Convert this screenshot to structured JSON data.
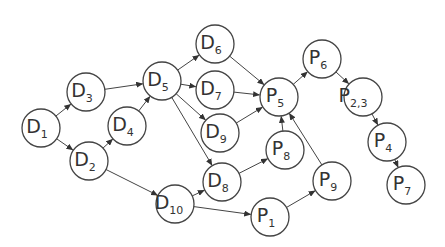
{
  "diagram": {
    "type": "directed-graph",
    "node_radius": 19,
    "colors": {
      "stroke": "#444444",
      "fill": "#ffffff",
      "text": "#333333"
    },
    "nodes": [
      {
        "id": "D1",
        "letter": "D",
        "sub": "1",
        "x": 41,
        "y": 128
      },
      {
        "id": "D2",
        "letter": "D",
        "sub": "2",
        "x": 89,
        "y": 161
      },
      {
        "id": "D3",
        "letter": "D",
        "sub": "3",
        "x": 86,
        "y": 92
      },
      {
        "id": "D4",
        "letter": "D",
        "sub": "4",
        "x": 127,
        "y": 126
      },
      {
        "id": "D5",
        "letter": "D",
        "sub": "5",
        "x": 162,
        "y": 81
      },
      {
        "id": "D6",
        "letter": "D",
        "sub": "6",
        "x": 215,
        "y": 44
      },
      {
        "id": "D7",
        "letter": "D",
        "sub": "7",
        "x": 215,
        "y": 90
      },
      {
        "id": "D8",
        "letter": "D",
        "sub": "8",
        "x": 222,
        "y": 182
      },
      {
        "id": "D9",
        "letter": "D",
        "sub": "9",
        "x": 220,
        "y": 133
      },
      {
        "id": "D10",
        "letter": "D",
        "sub": "10",
        "x": 175,
        "y": 204
      },
      {
        "id": "P1",
        "letter": "P",
        "sub": "1",
        "x": 270,
        "y": 217
      },
      {
        "id": "P23",
        "letter": "P",
        "sub": "2,3",
        "x": 363,
        "y": 97
      },
      {
        "id": "P4",
        "letter": "P",
        "sub": "4",
        "x": 387,
        "y": 142
      },
      {
        "id": "P5",
        "letter": "P",
        "sub": "5",
        "x": 279,
        "y": 97
      },
      {
        "id": "P6",
        "letter": "P",
        "sub": "6",
        "x": 322,
        "y": 59
      },
      {
        "id": "P7",
        "letter": "P",
        "sub": "7",
        "x": 406,
        "y": 185
      },
      {
        "id": "P8",
        "letter": "P",
        "sub": "8",
        "x": 285,
        "y": 150
      },
      {
        "id": "P9",
        "letter": "P",
        "sub": "9",
        "x": 332,
        "y": 181
      }
    ],
    "edges": [
      {
        "from": "D1",
        "to": "D3"
      },
      {
        "from": "D1",
        "to": "D2"
      },
      {
        "from": "D2",
        "to": "D4"
      },
      {
        "from": "D2",
        "to": "D10"
      },
      {
        "from": "D3",
        "to": "D5"
      },
      {
        "from": "D4",
        "to": "D5"
      },
      {
        "from": "D5",
        "to": "D6"
      },
      {
        "from": "D5",
        "to": "D7"
      },
      {
        "from": "D5",
        "to": "D9"
      },
      {
        "from": "D5",
        "to": "D8"
      },
      {
        "from": "D6",
        "to": "P5"
      },
      {
        "from": "D7",
        "to": "P5"
      },
      {
        "from": "D9",
        "to": "P5"
      },
      {
        "from": "D10",
        "to": "D8"
      },
      {
        "from": "D10",
        "to": "P1"
      },
      {
        "from": "D8",
        "to": "P8"
      },
      {
        "from": "P8",
        "to": "P5"
      },
      {
        "from": "P1",
        "to": "P9"
      },
      {
        "from": "P9",
        "to": "P5"
      },
      {
        "from": "P5",
        "to": "P6"
      },
      {
        "from": "P6",
        "to": "P23"
      },
      {
        "from": "P23",
        "to": "P4"
      },
      {
        "from": "P4",
        "to": "P7"
      }
    ]
  }
}
